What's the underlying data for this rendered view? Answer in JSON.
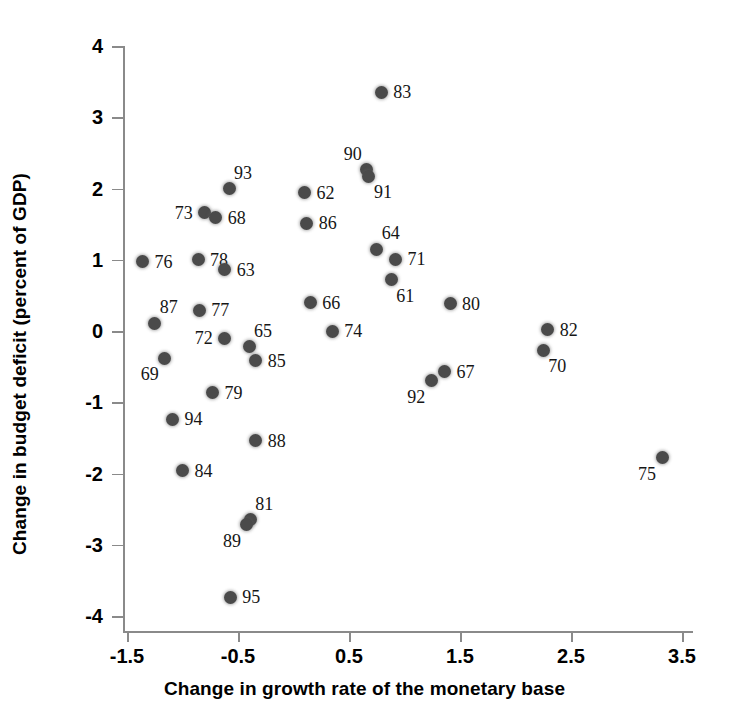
{
  "chart_data": {
    "type": "scatter",
    "title": "",
    "xlabel": "Change in growth rate of the monetary base",
    "ylabel": "Change in budget deficit (percent of GDP)",
    "xlim": [
      -1.5,
      3.5
    ],
    "ylim": [
      -4,
      4
    ],
    "xticks": [
      "-1.5",
      "-0.5",
      "0.5",
      "1.5",
      "2.5",
      "3.5"
    ],
    "xtick_values": [
      -1.5,
      -0.5,
      0.5,
      1.5,
      2.5,
      3.5
    ],
    "yticks": [
      "4",
      "3",
      "2",
      "1",
      "0",
      "-1",
      "-2",
      "-3",
      "-4"
    ],
    "ytick_values": [
      4,
      3,
      2,
      1,
      0,
      -1,
      -2,
      -3,
      -4
    ],
    "grid": false,
    "legend": null,
    "point_color": "#4a4a4a",
    "points": [
      {
        "label": "83",
        "x": 0.79,
        "y": 3.35,
        "lpos": "right"
      },
      {
        "label": "90",
        "x": 0.66,
        "y": 2.26,
        "lpos": "topleft"
      },
      {
        "label": "91",
        "x": 0.68,
        "y": 2.17,
        "lpos": "bottomright"
      },
      {
        "label": "93",
        "x": -0.58,
        "y": 2.0,
        "lpos": "topright"
      },
      {
        "label": "62",
        "x": 0.1,
        "y": 1.94,
        "lpos": "right"
      },
      {
        "label": "73",
        "x": -0.8,
        "y": 1.66,
        "lpos": "left"
      },
      {
        "label": "68",
        "x": -0.7,
        "y": 1.59,
        "lpos": "right"
      },
      {
        "label": "86",
        "x": 0.12,
        "y": 1.51,
        "lpos": "right"
      },
      {
        "label": "64",
        "x": 0.75,
        "y": 1.15,
        "lpos": "topright"
      },
      {
        "label": "71",
        "x": 0.92,
        "y": 1.01,
        "lpos": "right"
      },
      {
        "label": "78",
        "x": -0.86,
        "y": 1.0,
        "lpos": "right"
      },
      {
        "label": "76",
        "x": -1.36,
        "y": 0.97,
        "lpos": "right"
      },
      {
        "label": "63",
        "x": -0.62,
        "y": 0.86,
        "lpos": "right"
      },
      {
        "label": "61",
        "x": 0.88,
        "y": 0.72,
        "lpos": "bottomright"
      },
      {
        "label": "80",
        "x": 1.41,
        "y": 0.38,
        "lpos": "right"
      },
      {
        "label": "66",
        "x": 0.15,
        "y": 0.4,
        "lpos": "right"
      },
      {
        "label": "87",
        "x": -1.25,
        "y": 0.11,
        "lpos": "topright"
      },
      {
        "label": "82",
        "x": 2.29,
        "y": 0.02,
        "lpos": "right"
      },
      {
        "label": "74",
        "x": 0.35,
        "y": 0.0,
        "lpos": "right"
      },
      {
        "label": "77",
        "x": -0.85,
        "y": 0.29,
        "lpos": "right"
      },
      {
        "label": "72",
        "x": -0.62,
        "y": -0.1,
        "lpos": "left"
      },
      {
        "label": "65",
        "x": -0.4,
        "y": -0.22,
        "lpos": "topright"
      },
      {
        "label": "70",
        "x": 2.25,
        "y": -0.27,
        "lpos": "bottomright"
      },
      {
        "label": "69",
        "x": -1.16,
        "y": -0.38,
        "lpos": "bottomleft"
      },
      {
        "label": "85",
        "x": -0.34,
        "y": -0.42,
        "lpos": "right"
      },
      {
        "label": "67",
        "x": 1.36,
        "y": -0.57,
        "lpos": "right"
      },
      {
        "label": "92",
        "x": 1.24,
        "y": -0.7,
        "lpos": "bottomleft"
      },
      {
        "label": "79",
        "x": -0.73,
        "y": -0.87,
        "lpos": "right"
      },
      {
        "label": "94",
        "x": -1.09,
        "y": -1.24,
        "lpos": "right"
      },
      {
        "label": "88",
        "x": -0.34,
        "y": -1.54,
        "lpos": "right"
      },
      {
        "label": "75",
        "x": 3.32,
        "y": -1.78,
        "lpos": "bottomleft"
      },
      {
        "label": "84",
        "x": -1.0,
        "y": -1.96,
        "lpos": "right"
      },
      {
        "label": "81",
        "x": -0.39,
        "y": -2.65,
        "lpos": "topright"
      },
      {
        "label": "89",
        "x": -0.42,
        "y": -2.72,
        "lpos": "bottomleft"
      },
      {
        "label": "95",
        "x": -0.57,
        "y": -3.74,
        "lpos": "right"
      }
    ]
  }
}
